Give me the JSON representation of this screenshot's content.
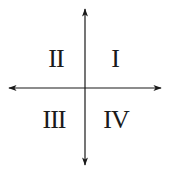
{
  "diagram": {
    "type": "cartesian-quadrants",
    "axes": {
      "horizontal": {
        "arrows": "both"
      },
      "vertical": {
        "arrows": "both"
      },
      "color": "#1a1a1a"
    },
    "quadrants": [
      {
        "position": "top-left",
        "label": "II"
      },
      {
        "position": "top-right",
        "label": "I"
      },
      {
        "position": "bottom-left",
        "label": "III"
      },
      {
        "position": "bottom-right",
        "label": "IV"
      }
    ]
  }
}
